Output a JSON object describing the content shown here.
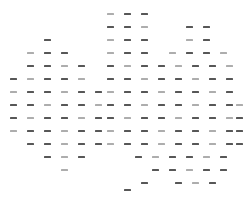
{
  "figure": {
    "kind": "dash-matrix",
    "background_color": "#ffffff",
    "mark_color": "#404040",
    "mark_glyph": "dash",
    "mark_width_px": 7,
    "mark_height_px": 2,
    "canvas_width_px": 250,
    "canvas_height_px": 198
  },
  "chart_data": {
    "type": "scatter",
    "title": "",
    "subtitle": "",
    "xlabel": "",
    "ylabel": "",
    "grid": false,
    "legend_position": "none",
    "xlim": [
      0,
      250
    ],
    "ylim": [
      0,
      198
    ],
    "column_origin_px": 14,
    "column_step_px": 17,
    "row_origin_px": 14,
    "row_step_px": 13,
    "column_count": 14,
    "row_count": 14,
    "column_x_px": [
      14,
      31,
      48,
      65,
      82,
      99,
      111,
      128,
      145,
      162,
      179,
      196,
      213,
      230
    ],
    "row_y_px": [
      14,
      27,
      40,
      53,
      66,
      79,
      92,
      105,
      118,
      131,
      144,
      157,
      170,
      190
    ],
    "rows": [
      {
        "index": 0,
        "y": 14,
        "x": [
          111,
          128,
          145
        ]
      },
      {
        "index": 1,
        "y": 27,
        "x": [
          111,
          128,
          145,
          190,
          207
        ]
      },
      {
        "index": 2,
        "y": 40,
        "x": [
          48,
          111,
          128,
          145,
          190,
          207
        ]
      },
      {
        "index": 3,
        "y": 53,
        "x": [
          31,
          48,
          65,
          111,
          128,
          145,
          173,
          190,
          207,
          224
        ]
      },
      {
        "index": 4,
        "y": 66,
        "x": [
          31,
          48,
          65,
          82,
          111,
          128,
          145,
          162,
          179,
          196,
          213,
          230
        ]
      },
      {
        "index": 5,
        "y": 79,
        "x": [
          14,
          31,
          48,
          65,
          82,
          111,
          128,
          145,
          162,
          179,
          196,
          213,
          230
        ]
      },
      {
        "index": 6,
        "y": 92,
        "x": [
          14,
          31,
          48,
          65,
          82,
          99,
          111,
          128,
          145,
          162,
          179,
          196,
          213,
          230
        ]
      },
      {
        "index": 7,
        "y": 105,
        "x": [
          14,
          31,
          48,
          65,
          82,
          99,
          111,
          128,
          145,
          162,
          179,
          196,
          213,
          230,
          240
        ]
      },
      {
        "index": 8,
        "y": 118,
        "x": [
          14,
          31,
          48,
          65,
          82,
          99,
          111,
          128,
          145,
          162,
          179,
          196,
          213,
          230,
          240
        ]
      },
      {
        "index": 9,
        "y": 131,
        "x": [
          14,
          31,
          48,
          65,
          82,
          99,
          111,
          128,
          145,
          162,
          179,
          196,
          213,
          230,
          240
        ]
      },
      {
        "index": 10,
        "y": 144,
        "x": [
          31,
          48,
          65,
          82,
          99,
          111,
          128,
          145,
          162,
          179,
          196,
          213,
          230,
          240
        ]
      },
      {
        "index": 11,
        "y": 157,
        "x": [
          48,
          65,
          82,
          139,
          156,
          173,
          190,
          207,
          224
        ]
      },
      {
        "index": 12,
        "y": 170,
        "x": [
          65,
          156,
          173,
          190,
          207,
          224
        ]
      },
      {
        "index": 13,
        "y": 183,
        "x": [
          145,
          179,
          196,
          213
        ]
      },
      {
        "index": 14,
        "y": 190,
        "x": [
          128
        ]
      }
    ],
    "total_marks": 154
  }
}
